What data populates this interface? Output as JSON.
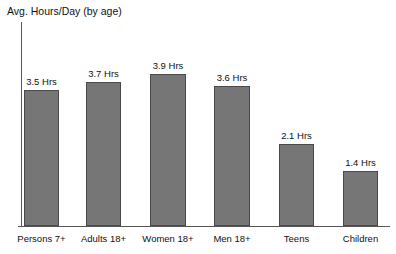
{
  "chart_data": {
    "type": "bar",
    "title": "Avg. Hours/Day (by age)",
    "xlabel": "",
    "ylabel": "Avg. Hours/Day",
    "unit": "Hrs",
    "ylim": [
      0,
      4.0
    ],
    "grid": false,
    "legend": "none",
    "categories": [
      "Persons 7+",
      "Adults 18+",
      "Women 18+",
      "Men 18+",
      "Teens",
      "Children"
    ],
    "values": [
      3.5,
      3.7,
      3.9,
      3.6,
      2.1,
      1.4
    ],
    "data_labels": [
      "3.5 Hrs",
      "3.7 Hrs",
      "3.9 Hrs",
      "3.6 Hrs",
      "2.1 Hrs",
      "1.4 Hrs"
    ],
    "bars": [
      {
        "category": "Persons 7+",
        "value": 3.5,
        "label": "3.5 Hrs",
        "left": 24,
        "width": 35
      },
      {
        "category": "Adults 18+",
        "value": 3.7,
        "label": "3.7 Hrs",
        "left": 86,
        "width": 35
      },
      {
        "category": "Women 18+",
        "value": 3.9,
        "label": "3.9 Hrs",
        "left": 150,
        "width": 36
      },
      {
        "category": "Men 18+",
        "value": 3.6,
        "label": "3.6 Hrs",
        "left": 214,
        "width": 36
      },
      {
        "category": "Teens",
        "value": 2.1,
        "label": "2.1 Hrs",
        "left": 279,
        "width": 35
      },
      {
        "category": "Children",
        "value": 1.4,
        "label": "1.4 Hrs",
        "left": 343,
        "width": 35
      }
    ],
    "colors": {
      "bar_fill": "#767676",
      "bar_stroke": "#4a4a4a",
      "axis": "#555555",
      "text": "#111111",
      "background": "#ffffff"
    }
  }
}
